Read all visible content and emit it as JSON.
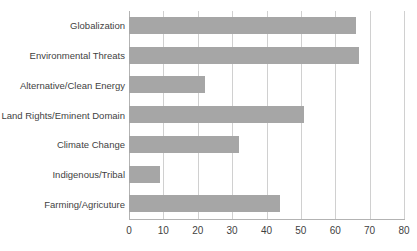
{
  "chart_data": {
    "type": "bar",
    "orientation": "horizontal",
    "title": "",
    "xlabel": "",
    "ylabel": "",
    "xlim": [
      0,
      80
    ],
    "xticks": [
      "0",
      "10",
      "20",
      "30",
      "40",
      "50",
      "60",
      "70",
      "80"
    ],
    "xtick_values": [
      0,
      10,
      20,
      30,
      40,
      50,
      60,
      70,
      80
    ],
    "grid": "vertical",
    "legend": "none",
    "categories": [
      "Globalization",
      "Environmental Threats",
      "Alternative/Clean Energy",
      "Land Rights/Eminent Domain",
      "Climate Change",
      "Indigenous/Tribal",
      "Farming/Agricuture"
    ],
    "values": [
      66,
      67,
      22,
      51,
      32,
      9,
      44
    ],
    "bar_color": "#a6a6a6",
    "gridline_color": "#d0d0d0",
    "axis_color": "#b3b3b3",
    "text_color": "#3f3f3f",
    "background": "#ffffff"
  }
}
